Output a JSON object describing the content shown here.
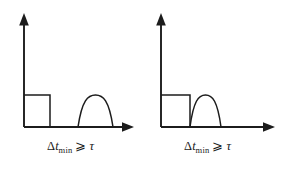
{
  "figure": {
    "name": "minimum-time-interval-diagram",
    "background_color": "#ffffff",
    "stroke_color": "#1c1c1c",
    "panel_count": 2
  },
  "caption_symbols": {
    "delta": "Δ",
    "variable": "t",
    "subscript": "min",
    "relation": "⩾",
    "tau": "τ",
    "full_text": "Δt_min ⩾ τ"
  },
  "panels": [
    {
      "id": "left",
      "label": "Δt_min ⩾ τ",
      "description": "rectangular pulse separated by a gap from a dome-shaped pulse",
      "axes": {
        "origin_x": 24,
        "baseline_y": 127,
        "y_axis_top": 16,
        "x_axis_right": 133
      },
      "rectangle": {
        "x_start": 24,
        "x_end": 50,
        "top_y": 95,
        "height": 32
      },
      "bump": {
        "x_start": 78,
        "x_end": 113,
        "peak_x": 95.5,
        "peak_y": 101,
        "height": 26
      },
      "gap_between_shapes": true
    },
    {
      "id": "right",
      "label": "Δt_min ⩾ τ",
      "description": "rectangular pulse immediately adjoining a dome-shaped pulse",
      "axes": {
        "origin_x": 20,
        "baseline_y": 127,
        "y_axis_top": 16,
        "x_axis_right": 133
      },
      "rectangle": {
        "x_start": 20,
        "x_end": 49,
        "top_y": 95,
        "height": 32
      },
      "bump": {
        "x_start": 49,
        "x_end": 80,
        "peak_x": 64.5,
        "peak_y": 101,
        "height": 26
      },
      "gap_between_shapes": false
    }
  ]
}
